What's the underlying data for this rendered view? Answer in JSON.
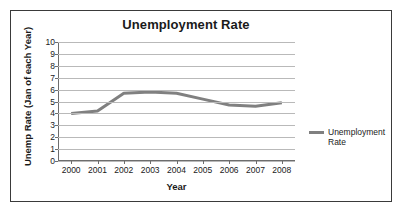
{
  "chart_data": {
    "type": "line",
    "title": "Unemployment Rate",
    "xlabel": "Year",
    "ylabel": "Unemp Rate (Jan of each Year)",
    "categories": [
      "2000",
      "2001",
      "2002",
      "2003",
      "2004",
      "2005",
      "2006",
      "2007",
      "2008"
    ],
    "x": [
      2000,
      2001,
      2002,
      2003,
      2004,
      2005,
      2006,
      2007,
      2008
    ],
    "series": [
      {
        "name": "Unemployment Rate",
        "values": [
          4.0,
          4.2,
          5.7,
          5.8,
          5.7,
          5.2,
          4.7,
          4.6,
          4.9
        ],
        "color": "#808080"
      }
    ],
    "ylim": [
      0,
      10
    ],
    "ytick_step": 1,
    "yticks": [
      "10",
      "9",
      "8",
      "7",
      "6",
      "5",
      "4",
      "3",
      "2",
      "1",
      "0"
    ],
    "grid": true,
    "grid_axis": "y",
    "grid_color": "#b9b9b9",
    "legend_position": "right",
    "legend_entries": [
      "Unemployment Rate"
    ],
    "frame_border_color": "#3a3a3a",
    "axis_color": "#6d6d6d",
    "background": "#ffffff"
  },
  "legend": {
    "entry_label": "Unemployment Rate"
  }
}
